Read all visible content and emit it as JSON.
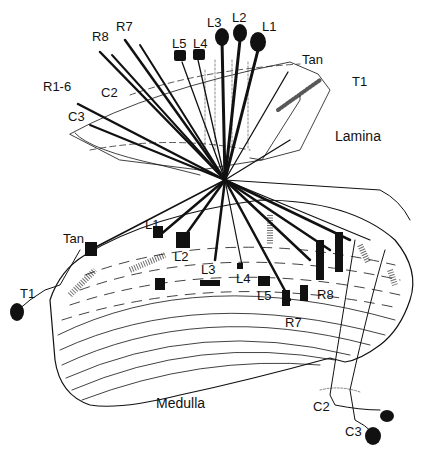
{
  "diagram": {
    "title": "",
    "regions": {
      "lamina": "Lamina",
      "medulla": "Medulla"
    },
    "lamina_labels": {
      "r1_6": "R1-6",
      "r8": "R8",
      "r7": "R7",
      "c2": "C2",
      "c3": "C3",
      "l5": "L5",
      "l4": "L4",
      "l3": "L3",
      "l2": "L2",
      "l1": "L1",
      "tan": "Tan",
      "t1": "T1"
    },
    "medulla_labels": {
      "tan": "Tan",
      "t1": "T1",
      "l1": "L1",
      "l2": "L2",
      "l3": "L3",
      "l4": "L4",
      "l5": "L5",
      "r7": "R7",
      "r8": "R8",
      "c2": "C2",
      "c3": "C3"
    },
    "colors": {
      "ink": "#111111",
      "background": "#ffffff"
    }
  }
}
